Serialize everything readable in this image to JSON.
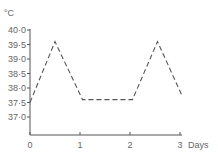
{
  "chart_data": {
    "type": "line",
    "title": "",
    "xlabel": "Days",
    "ylabel": "°C",
    "xlim": [
      0,
      3
    ],
    "ylim": [
      37.0,
      40.0
    ],
    "x_ticks": [
      "0",
      "1",
      "2",
      "3"
    ],
    "y_ticks": [
      "37·0",
      "37·5",
      "38·0",
      "38·5",
      "39·0",
      "39·5",
      "40·0"
    ],
    "grid": false,
    "legend": null,
    "line_style": "dashed",
    "series": [
      {
        "name": "Temperature",
        "x": [
          0,
          0.5,
          1.05,
          2.05,
          2.55,
          3.05
        ],
        "values": [
          37.5,
          39.6,
          37.6,
          37.6,
          39.6,
          37.7
        ]
      }
    ]
  },
  "axes": {
    "y_unit": "°C",
    "x_unit": "Days"
  }
}
